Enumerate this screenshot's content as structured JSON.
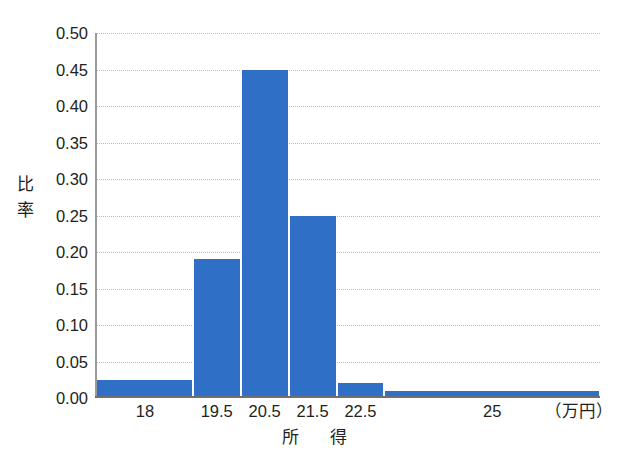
{
  "chart_data": {
    "type": "bar",
    "title": "",
    "subtitle": "",
    "xlabel": "所　得",
    "x_unit_label": "（万円）",
    "ylabel": "比率",
    "ylabel_chars": [
      "比",
      "率"
    ],
    "categories": [
      "18",
      "19.5",
      "20.5",
      "21.5",
      "22.5",
      "25"
    ],
    "values": [
      0.025,
      0.19,
      0.45,
      0.25,
      0.02,
      0.01
    ],
    "bin_edges": [
      17.0,
      19.0,
      20.0,
      21.0,
      22.0,
      23.0,
      27.5
    ],
    "bars": [
      {
        "label": "18",
        "value": 0.025,
        "x_start": 17.0,
        "x_end": 19.0
      },
      {
        "label": "19.5",
        "value": 0.19,
        "x_start": 19.0,
        "x_end": 20.0
      },
      {
        "label": "20.5",
        "value": 0.45,
        "x_start": 20.0,
        "x_end": 21.0
      },
      {
        "label": "21.5",
        "value": 0.25,
        "x_start": 21.0,
        "x_end": 22.0
      },
      {
        "label": "22.5",
        "value": 0.02,
        "x_start": 22.0,
        "x_end": 23.0
      },
      {
        "label": "25",
        "value": 0.01,
        "x_start": 23.0,
        "x_end": 27.5
      }
    ],
    "ylim": [
      0.0,
      0.5
    ],
    "y_ticks": [
      "0.00",
      "0.05",
      "0.10",
      "0.15",
      "0.20",
      "0.25",
      "0.30",
      "0.35",
      "0.40",
      "0.45",
      "0.50"
    ],
    "y_tick_values": [
      0.0,
      0.05,
      0.1,
      0.15,
      0.2,
      0.25,
      0.3,
      0.35,
      0.4,
      0.45,
      0.5
    ],
    "x_tick_labels": [
      "18",
      "19.5",
      "20.5",
      "21.5",
      "22.5",
      "25"
    ],
    "grid": true,
    "grid_style": "horizontal-dotted",
    "legend": false,
    "legend_position": "none",
    "bar_color": "#2f70c6",
    "grid_color": "#b9b9b9",
    "axis_color": "#6f6f6f",
    "text_color": "#231f20",
    "background": "#ffffff"
  }
}
